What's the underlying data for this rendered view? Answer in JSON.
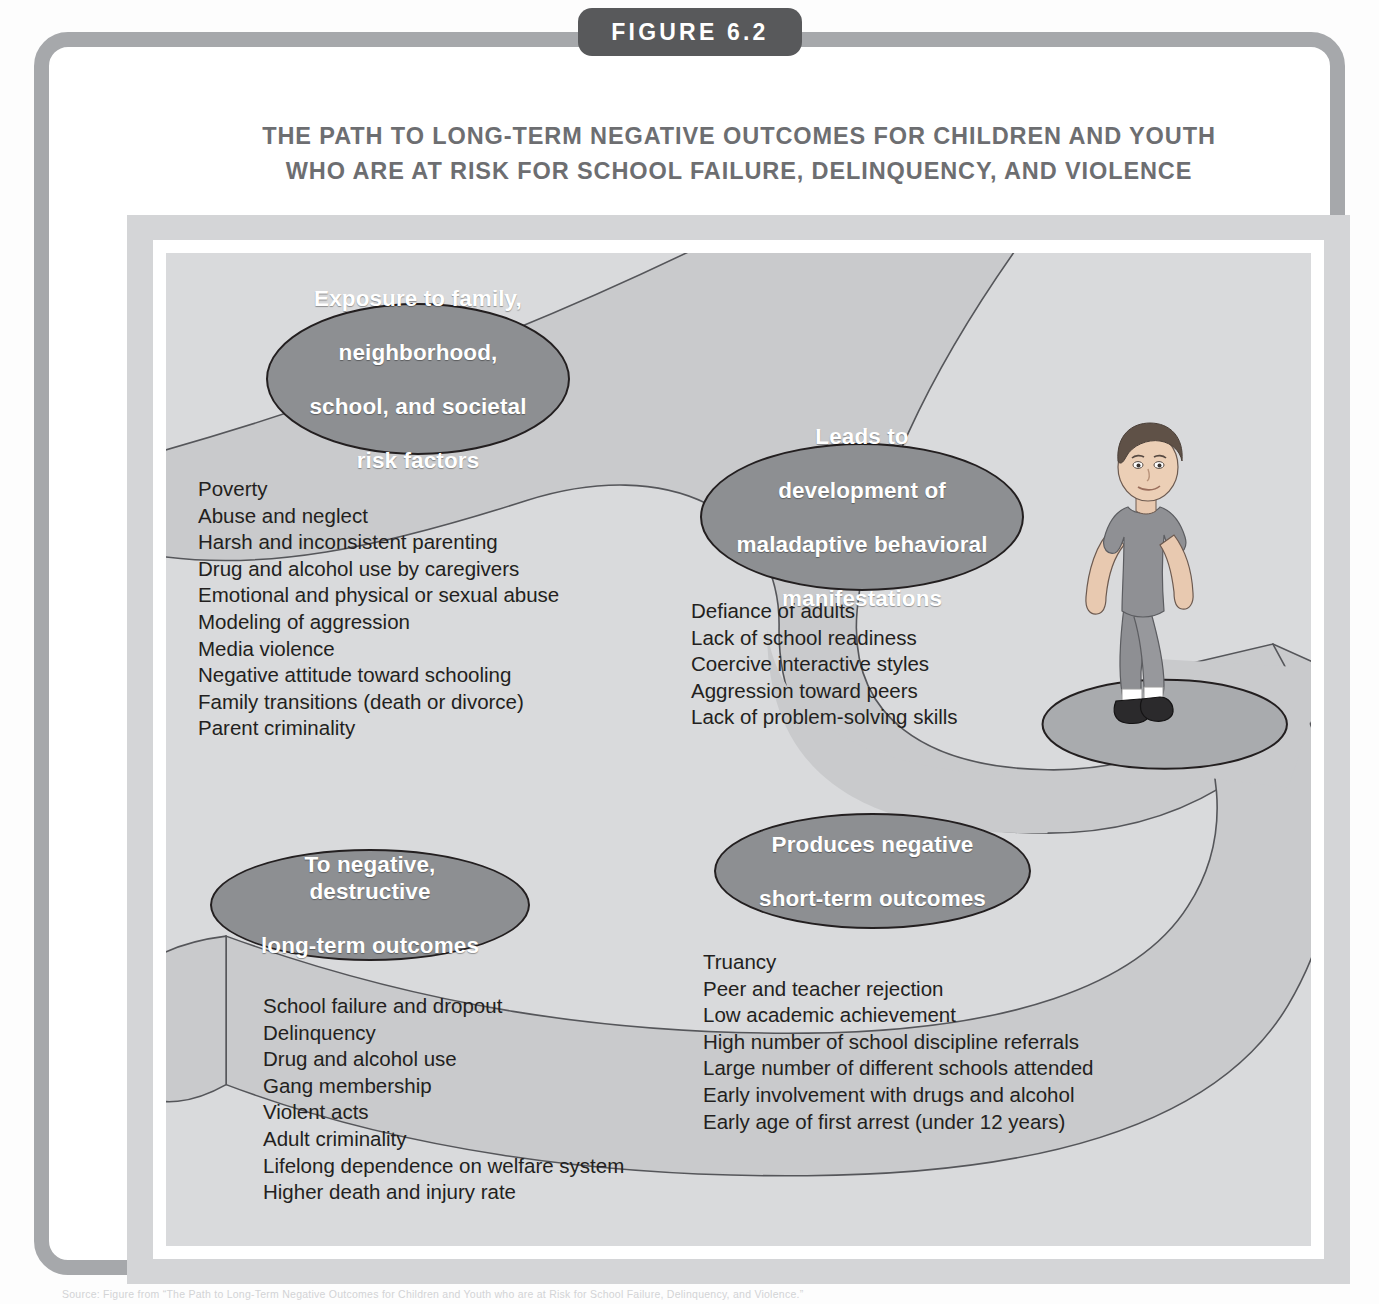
{
  "figure": {
    "badge_label": "FIGURE 6.2",
    "title_line1": "THE PATH TO LONG-TERM NEGATIVE OUTCOMES FOR CHILDREN AND YOUTH",
    "title_line2": "WHO ARE AT RISK FOR SCHOOL FAILURE, DELINQUENCY, AND VIOLENCE",
    "source_caption": "Source: Figure from “The Path to Long-Term Negative Outcomes for Children and Youth who are at Risk for School Failure, Delinquency, and Violence.”"
  },
  "colors": {
    "frame": "#a6a8ab",
    "badge": "#58595b",
    "title_text": "#6d6e71",
    "plate": "#d4d5d7",
    "canvas": "#d9dadc",
    "path_band": "#c9cacc",
    "node_fill": "#8d8f92",
    "node_stroke": "#231f20",
    "node_text": "#ffffff",
    "body_text": "#231f20"
  },
  "nodes": [
    {
      "id": "exposure",
      "label": "Exposure to family, neighborhood, school, and societal risk factors",
      "lines": [
        "Exposure to family,",
        "neighborhood,",
        "school, and societal",
        "risk factors"
      ]
    },
    {
      "id": "leads",
      "label": "Leads to development of maladaptive behavioral manifestations",
      "lines": [
        "Leads to",
        "development of",
        "maladaptive behavioral",
        "manifestations"
      ]
    },
    {
      "id": "produces",
      "label": "Produces negative short-term outcomes",
      "lines": [
        "Produces negative",
        "short-term outcomes"
      ]
    },
    {
      "id": "longterm",
      "label": "To negative, destructive long-term outcomes",
      "lines": [
        "To negative, destructive",
        "long-term outcomes"
      ]
    }
  ],
  "lists": {
    "risk_factors": [
      "Poverty",
      "Abuse and neglect",
      "Harsh and inconsistent parenting",
      "Drug and alcohol use by caregivers",
      "Emotional and physical or sexual abuse",
      "Modeling of aggression",
      "Media violence",
      "Negative attitude toward schooling",
      "Family transitions (death or divorce)",
      "Parent criminality"
    ],
    "maladaptive_manifestations": [
      "Defiance of adults",
      "Lack of school readiness",
      "Coercive interactive styles",
      "Aggression toward peers",
      "Lack of problem-solving skills"
    ],
    "short_term_outcomes": [
      "Truancy",
      "Peer and teacher rejection",
      "Low academic achievement",
      "High number of school discipline referrals",
      "Large number of different schools attended",
      "Early involvement with drugs and alcohol",
      "Early age of first arrest (under 12 years)"
    ],
    "long_term_outcomes": [
      "School failure and dropout",
      "Delinquency",
      "Drug and alcohol use",
      "Gang membership",
      "Violent acts",
      "Adult criminality",
      "Lifelong dependence on welfare system",
      "Higher death and injury rate"
    ]
  },
  "illustration": {
    "name": "walking-boy",
    "description": "Illustration of a boy walking along the path"
  }
}
